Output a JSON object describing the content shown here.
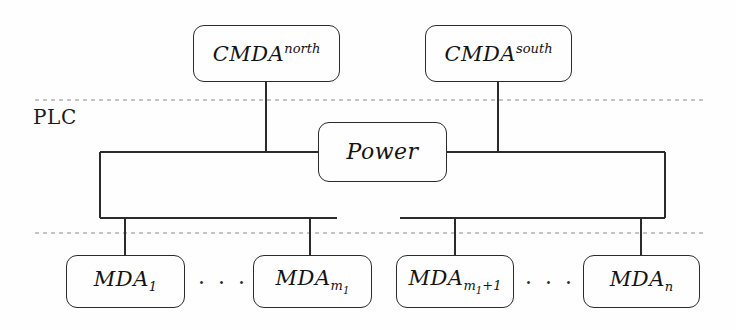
{
  "diagram": {
    "background_color": "#fefefe",
    "line_color": "#2b2b2b",
    "dashed_color": "#8a8a8a",
    "text_color": "#131313",
    "zones": [
      {
        "id": "plc",
        "label": "PLC"
      }
    ],
    "nodes": [
      {
        "id": "cmda-north",
        "base": "CMDA",
        "superscript": "north",
        "subscript": "",
        "x": 193,
        "y": 25,
        "w": 147,
        "h": 57
      },
      {
        "id": "cmda-south",
        "base": "CMDA",
        "superscript": "south",
        "subscript": "",
        "x": 425,
        "y": 25,
        "w": 147,
        "h": 57
      },
      {
        "id": "power",
        "base": "Power",
        "superscript": "",
        "subscript": "",
        "x": 318,
        "y": 122,
        "w": 129,
        "h": 60
      },
      {
        "id": "mda-1",
        "base": "MDA",
        "superscript": "",
        "subscript": "1",
        "x": 66,
        "y": 255,
        "w": 119,
        "h": 53
      },
      {
        "id": "mda-m1",
        "base": "MDA",
        "superscript": "",
        "subscript": "m",
        "subsubscript": "1",
        "x": 253,
        "y": 255,
        "w": 119,
        "h": 53
      },
      {
        "id": "mda-m1-plus-1",
        "base": "MDA",
        "superscript": "",
        "subscript": "m",
        "subsubscript": "1",
        "subtail": "+1",
        "x": 396,
        "y": 255,
        "w": 118,
        "h": 53
      },
      {
        "id": "mda-n",
        "base": "MDA",
        "superscript": "",
        "subscript": "n",
        "x": 583,
        "y": 255,
        "w": 117,
        "h": 53
      }
    ],
    "ellipses": [
      {
        "id": "ellipsis-left",
        "text": "· · ·",
        "x": 196,
        "y": 272,
        "w": 54
      },
      {
        "id": "ellipsis-right",
        "text": "· · ·",
        "x": 523,
        "y": 272,
        "w": 54
      }
    ],
    "boundaries": [
      {
        "id": "plc-top-boundary",
        "x1": 35,
        "y1": 100,
        "x2": 705,
        "y2": 100
      },
      {
        "id": "plc-bottom-boundary",
        "x1": 35,
        "y1": 233,
        "x2": 705,
        "y2": 233
      }
    ],
    "wires": [
      {
        "id": "cmda-north-drop",
        "x1": 266,
        "y1": 82,
        "x2": 266,
        "y2": 152
      },
      {
        "id": "cmda-south-drop",
        "x1": 498,
        "y1": 82,
        "x2": 498,
        "y2": 152
      },
      {
        "id": "bus-top-left",
        "x1": 100,
        "y1": 152,
        "x2": 318,
        "y2": 152
      },
      {
        "id": "bus-top-right",
        "x1": 447,
        "y1": 152,
        "x2": 665,
        "y2": 152
      },
      {
        "id": "bus-left-riser",
        "x1": 100,
        "y1": 152,
        "x2": 100,
        "y2": 218
      },
      {
        "id": "bus-right-riser",
        "x1": 665,
        "y1": 152,
        "x2": 665,
        "y2": 218
      },
      {
        "id": "bus-bottom-left",
        "x1": 100,
        "y1": 218,
        "x2": 337,
        "y2": 218
      },
      {
        "id": "bus-bottom-right",
        "x1": 400,
        "y1": 218,
        "x2": 665,
        "y2": 218
      },
      {
        "id": "mda-1-drop",
        "x1": 125,
        "y1": 218,
        "x2": 125,
        "y2": 255
      },
      {
        "id": "mda-m1-drop",
        "x1": 310,
        "y1": 218,
        "x2": 310,
        "y2": 255
      },
      {
        "id": "mda-m1-plus-1-drop",
        "x1": 455,
        "y1": 218,
        "x2": 455,
        "y2": 255
      },
      {
        "id": "mda-n-drop",
        "x1": 641,
        "y1": 218,
        "x2": 641,
        "y2": 255
      }
    ],
    "zone_label_position": {
      "x": 33,
      "y": 107
    }
  }
}
